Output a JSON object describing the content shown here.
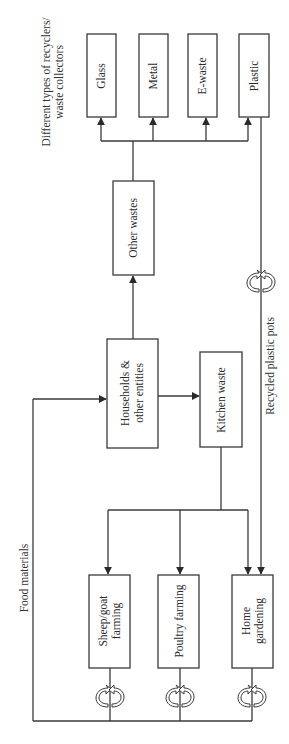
{
  "diagram": {
    "header": {
      "line1": "Different types of recyclers/",
      "line2": "waste collectors"
    },
    "recyclers": [
      {
        "label": "Glass"
      },
      {
        "label": "Metal"
      },
      {
        "label": "E-waste"
      },
      {
        "label": "Plastic"
      }
    ],
    "nodes": {
      "other_wastes": "Other wastes",
      "households_line1": "Households &",
      "households_line2": "other entities",
      "kitchen_waste": "Kitchen waste",
      "sheep_line1": "Sheep/goat",
      "sheep_line2": "farming",
      "poultry": "Poultry farming",
      "garden_line1": "Home",
      "garden_line2": "gardening"
    },
    "edge_labels": {
      "food_materials": "Food materials",
      "recycled_plastic_pots": "Recycled plastic pots"
    },
    "icons": [
      "recycle-cycle-icon",
      "recycle-cycle-icon",
      "recycle-cycle-icon",
      "recycle-cycle-icon"
    ],
    "colors": {
      "line": "#3a3a3a",
      "text": "#2a2a2a",
      "background": "#ffffff"
    }
  }
}
